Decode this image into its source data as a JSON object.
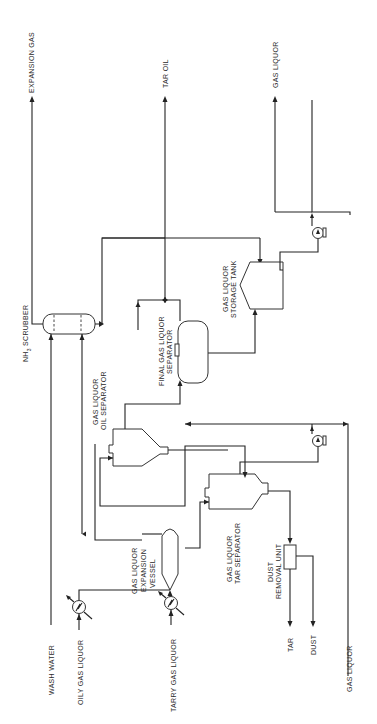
{
  "diagram": {
    "type": "process-flow",
    "orientation": "rotated-90-ccw",
    "equipment": {
      "nh3_scrubber": "NH3 SCRUBBER",
      "nh3_prefix": "NH",
      "nh3_sub": "3",
      "nh3_suffix": " SCRUBBER",
      "oil_separator_l1": "GAS LIQUOR",
      "oil_separator_l2": "OIL SEPARATOR",
      "final_separator_l1": "FINAL GAS LIQUOR",
      "final_separator_l2": "SEPARATOR",
      "storage_tank_l1": "GAS LIQUOR",
      "storage_tank_l2": "STORAGE TANK",
      "expansion_vessel_l1": "GAS LIQUOR",
      "expansion_vessel_l2": "EXPANSION",
      "expansion_vessel_l3": "VESSEL",
      "tar_separator_l1": "GAS LIQUOR",
      "tar_separator_l2": "TAR SEPARATOR",
      "dust_removal_l1": "DUST",
      "dust_removal_l2": "REMOVAL UNIT"
    },
    "streams": {
      "expansion_gas": "EXPANSION GAS",
      "tar_oil": "TAR OIL",
      "gas_liquor_out": "GAS LIQUOR",
      "wash_water": "WASH WATER",
      "oily_gas_liquor": "OILY GAS LIQUOR",
      "tarry_gas_liquor": "TARRY GAS LIQUOR",
      "tar": "TAR",
      "dust": "DUST",
      "gas_liquor_in": "GAS LIQUOR"
    }
  }
}
